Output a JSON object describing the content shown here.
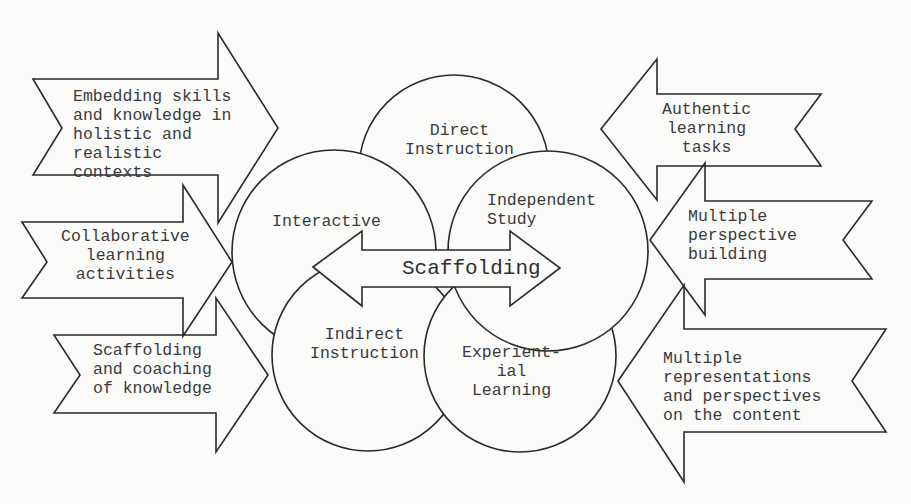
{
  "diagram": {
    "title": "Scaffolding",
    "circles": [
      {
        "id": "direct",
        "label": "Direct\nInstruction"
      },
      {
        "id": "interactive",
        "label": "Interactive"
      },
      {
        "id": "independent",
        "label": "Independent\nStudy"
      },
      {
        "id": "indirect",
        "label": "Indirect\nInstruction"
      },
      {
        "id": "experiential",
        "label": "Experient-\nial\nLearning"
      }
    ],
    "left_arrows": [
      {
        "label": "Embedding skills\nand knowledge in\nholistic and\nrealistic\ncontexts"
      },
      {
        "label": "Collaborative\nlearning\nactivities"
      },
      {
        "label": "Scaffolding\nand coaching\nof knowledge"
      }
    ],
    "right_arrows": [
      {
        "label": "Authentic\nlearning\ntasks"
      },
      {
        "label": "Multiple\nperspective\nbuilding"
      },
      {
        "label": "Multiple\nrepresentations\nand perspectives\non the content"
      }
    ],
    "colors": {
      "stroke": "#2a2a2a",
      "fill": "#fbfbfa",
      "text": "#3a3a3a"
    }
  }
}
